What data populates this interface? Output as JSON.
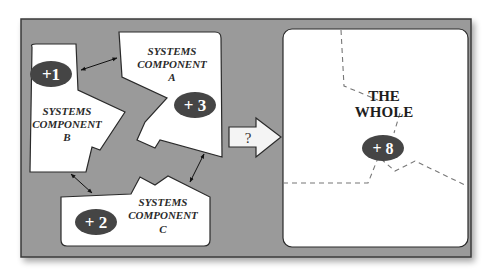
{
  "diagram": {
    "colors": {
      "frame_bg": "#9a9a9a",
      "frame_border": "#3a3a3a",
      "shape_fill": "#ffffff",
      "badge_fill": "#4a4a4a",
      "dash_color": "#777777"
    },
    "components": [
      {
        "id": "A",
        "line1": "SYSTEMS",
        "line2": "COMPONENT",
        "line3": "A",
        "badge": "+ 3"
      },
      {
        "id": "B",
        "line1": "SYSTEMS",
        "line2": "COMPONENT",
        "line3": "B",
        "badge": "+1"
      },
      {
        "id": "C",
        "line1": "SYSTEMS",
        "line2": "COMPONENT",
        "line3": "C",
        "badge": "+ 2"
      }
    ],
    "arrow": {
      "label": "?"
    },
    "whole": {
      "line1": "THE",
      "line2": "WHOLE",
      "badge": "+ 8"
    }
  }
}
